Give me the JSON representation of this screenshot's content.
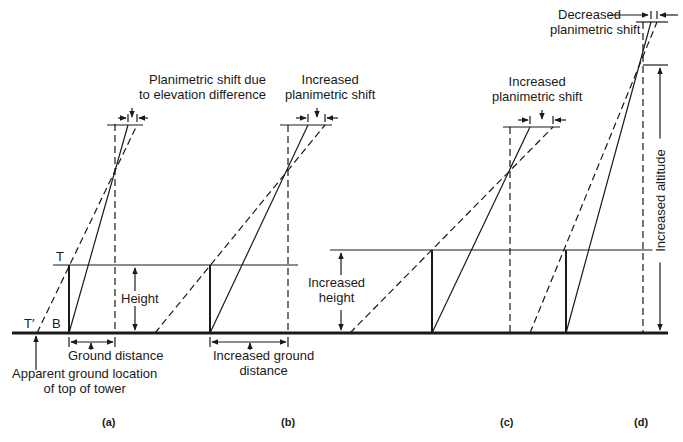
{
  "figure": {
    "panels": [
      {
        "id": "a",
        "caption": "(a)",
        "top_label": [
          "Planimetric shift due",
          "to elevation difference"
        ],
        "labels": {
          "top_point": "T",
          "base_point": "B",
          "apparent_point": "T′",
          "height": "Height",
          "ground_distance": "Ground distance",
          "apparent_location": [
            "Apparent ground location",
            "of top of tower"
          ]
        }
      },
      {
        "id": "b",
        "caption": "(b)",
        "top_label": [
          "Increased",
          "planimetric shift"
        ],
        "labels": {
          "ground_distance": [
            "Increased ground",
            "distance"
          ]
        }
      },
      {
        "id": "c",
        "caption": "(c)",
        "top_label": [
          "Increased",
          "planimetric shift"
        ],
        "labels": {
          "height": [
            "Increased",
            "height"
          ]
        }
      },
      {
        "id": "d",
        "caption": "(d)",
        "top_label": [
          "Decreased",
          "planimetric shift"
        ],
        "labels": {
          "altitude": "Increased altitude"
        }
      }
    ],
    "colors": {
      "line": "#1a1a1a",
      "background": "#ffffff"
    }
  }
}
